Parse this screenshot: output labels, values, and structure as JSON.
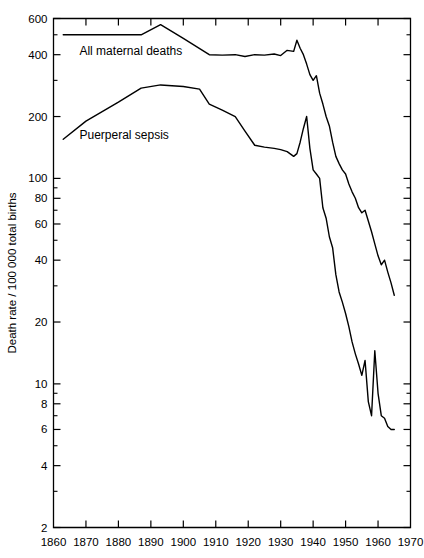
{
  "chart_data": {
    "type": "line",
    "title": "",
    "subtitle": "",
    "xlabel": "",
    "ylabel": "Death rate / 100 000 total births",
    "yscale": "log",
    "xlim": [
      1860,
      1970
    ],
    "ylim": [
      2,
      600
    ],
    "grid": false,
    "legend_position": "inline-annotations",
    "x_ticks": [
      1860,
      1870,
      1880,
      1890,
      1900,
      1910,
      1920,
      1930,
      1940,
      1950,
      1960,
      1970
    ],
    "x_tick_labels": [
      "1860",
      "1870",
      "1880",
      "1890",
      "1900",
      "1910",
      "1920",
      "1930",
      "1940",
      "1950",
      "1960",
      "1970"
    ],
    "y_ticks": [
      2,
      4,
      6,
      8,
      10,
      20,
      40,
      60,
      80,
      100,
      200,
      400,
      600
    ],
    "y_tick_labels": [
      "2",
      "4",
      "6",
      "8",
      "10",
      "20",
      "40",
      "60",
      "80",
      "100",
      "200",
      "400",
      "600"
    ],
    "y_minor_ticks": [
      3,
      5,
      7,
      9,
      30,
      50,
      70,
      90,
      300,
      500
    ],
    "annotations": [
      {
        "text": "All maternal deaths",
        "x": 1868,
        "y": 400
      },
      {
        "text": "Puerperal sepsis",
        "x": 1868,
        "y": 155
      }
    ],
    "series": [
      {
        "name": "All maternal deaths",
        "x": [
          1863,
          1870,
          1880,
          1887,
          1893,
          1900,
          1908,
          1912,
          1916,
          1919,
          1922,
          1925,
          1928,
          1930,
          1932,
          1934,
          1935,
          1936,
          1937,
          1938,
          1939,
          1940,
          1941,
          1942,
          1943,
          1944,
          1945,
          1946,
          1947,
          1948,
          1949,
          1950,
          1951,
          1952,
          1953,
          1954,
          1955,
          1956,
          1957,
          1958,
          1959,
          1960,
          1961,
          1962,
          1963,
          1964,
          1965
        ],
        "y": [
          500,
          500,
          500,
          500,
          560,
          480,
          400,
          398,
          400,
          392,
          400,
          398,
          403,
          396,
          420,
          415,
          470,
          430,
          400,
          360,
          320,
          300,
          316,
          260,
          230,
          200,
          180,
          150,
          128,
          118,
          110,
          105,
          94,
          86,
          80,
          72,
          68,
          70,
          62,
          55,
          48,
          42,
          38,
          40,
          35,
          31,
          27
        ]
      },
      {
        "name": "Puerperal sepsis",
        "x": [
          1863,
          1870,
          1880,
          1887,
          1893,
          1900,
          1905,
          1908,
          1912,
          1916,
          1919,
          1922,
          1925,
          1928,
          1930,
          1932,
          1934,
          1935,
          1936,
          1937,
          1938,
          1939,
          1940,
          1941,
          1942,
          1943,
          1944,
          1945,
          1946,
          1947,
          1948,
          1949,
          1950,
          1951,
          1952,
          1953,
          1954,
          1955,
          1956,
          1957,
          1958,
          1959,
          1960,
          1961,
          1962,
          1963,
          1964,
          1965
        ],
        "y": [
          155,
          190,
          235,
          275,
          285,
          280,
          272,
          230,
          215,
          200,
          170,
          145,
          142,
          140,
          138,
          135,
          128,
          132,
          150,
          175,
          200,
          140,
          110,
          105,
          100,
          72,
          64,
          52,
          46,
          34,
          28,
          25,
          22,
          19,
          16,
          14,
          12.5,
          11,
          13,
          8.2,
          7.0,
          14.5,
          9.0,
          7.0,
          6.8,
          6.2,
          6.0,
          6.0
        ]
      }
    ]
  }
}
